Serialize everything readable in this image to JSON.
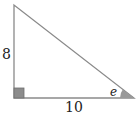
{
  "diagram": {
    "type": "right-triangle",
    "labels": {
      "vertical_side": "8",
      "horizontal_side": "10",
      "angle": "e"
    },
    "colors": {
      "stroke": "#8a8a8a",
      "right_angle_fill": "#8c8c8c",
      "angle_fill": "#999999",
      "text": "#222222"
    }
  }
}
